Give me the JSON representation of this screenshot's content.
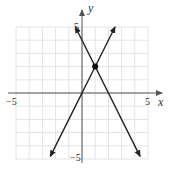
{
  "chart_data": {
    "type": "line",
    "title": "",
    "xlabel": "x",
    "ylabel": "y",
    "xlim": [
      -5,
      5
    ],
    "ylim": [
      -5,
      5
    ],
    "grid": true,
    "x_tick_labels": [
      "-5",
      "5"
    ],
    "y_tick_labels": [
      "5",
      "-5"
    ],
    "series": [
      {
        "name": "line-1",
        "equation": "y = 2x",
        "slope": 2,
        "intercept": 0,
        "x": [
          -2.4,
          2.5
        ],
        "y": [
          -4.8,
          5.0
        ],
        "arrows": "both"
      },
      {
        "name": "line-2",
        "equation": "y = -2x + 4",
        "slope": -2,
        "intercept": 4,
        "x": [
          -0.5,
          4.4
        ],
        "y": [
          5.0,
          -4.8
        ],
        "arrows": "both"
      }
    ],
    "points": [
      {
        "label": "intersection",
        "x": 1,
        "y": 2
      }
    ]
  },
  "labels": {
    "x_axis": "x",
    "y_axis": "y",
    "x_min": "−5",
    "x_max": "5",
    "y_max": "5",
    "y_min": "−5"
  },
  "colors": {
    "grid": "#e4e4e4",
    "axis": "#555555",
    "line": "#222222"
  }
}
